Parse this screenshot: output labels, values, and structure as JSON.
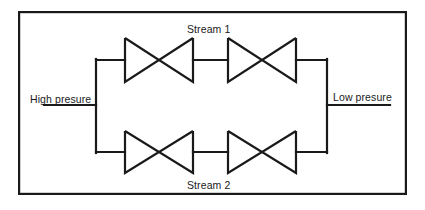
{
  "figure": {
    "width": 425,
    "height": 210,
    "background_color": "#ffffff",
    "line_color": "#1a1a1a",
    "text_color": "#1a1a1a"
  },
  "labels": {
    "high_pressure": "High presure",
    "low_pressure": "Low presure",
    "stream_1": "Stream 1",
    "stream_2": "Stream 2"
  },
  "border": {
    "x": 18,
    "y": 11,
    "width": 389,
    "height": 184,
    "stroke_width": 2.2
  },
  "piping": {
    "inlet_line": {
      "x1": 44,
      "y1": 105,
      "x2": 96,
      "y2": 105
    },
    "outlet_line": {
      "x1": 327,
      "y1": 105,
      "x2": 390,
      "y2": 105
    },
    "left_manifold": {
      "x": 96,
      "y_top": 60,
      "y_bottom": 152
    },
    "right_manifold": {
      "x": 327,
      "y_top": 60,
      "y_bottom": 152
    },
    "top_stream_y": 60,
    "bottom_stream_y": 152,
    "stroke_width": 2.2
  },
  "valves": [
    {
      "name": "valve-stream1-left",
      "stream": "Stream 1",
      "position": "left",
      "center_x": 159,
      "center_y": 60,
      "half_width": 34,
      "half_height": 22
    },
    {
      "name": "valve-stream1-right",
      "stream": "Stream 1",
      "position": "right",
      "center_x": 262,
      "center_y": 60,
      "half_width": 34,
      "half_height": 22
    },
    {
      "name": "valve-stream2-left",
      "stream": "Stream 2",
      "position": "left",
      "center_x": 159,
      "center_y": 152,
      "half_width": 34,
      "half_height": 21
    },
    {
      "name": "valve-stream2-right",
      "stream": "Stream 2",
      "position": "right",
      "center_x": 262,
      "center_y": 152,
      "half_width": 34,
      "half_height": 21
    }
  ]
}
